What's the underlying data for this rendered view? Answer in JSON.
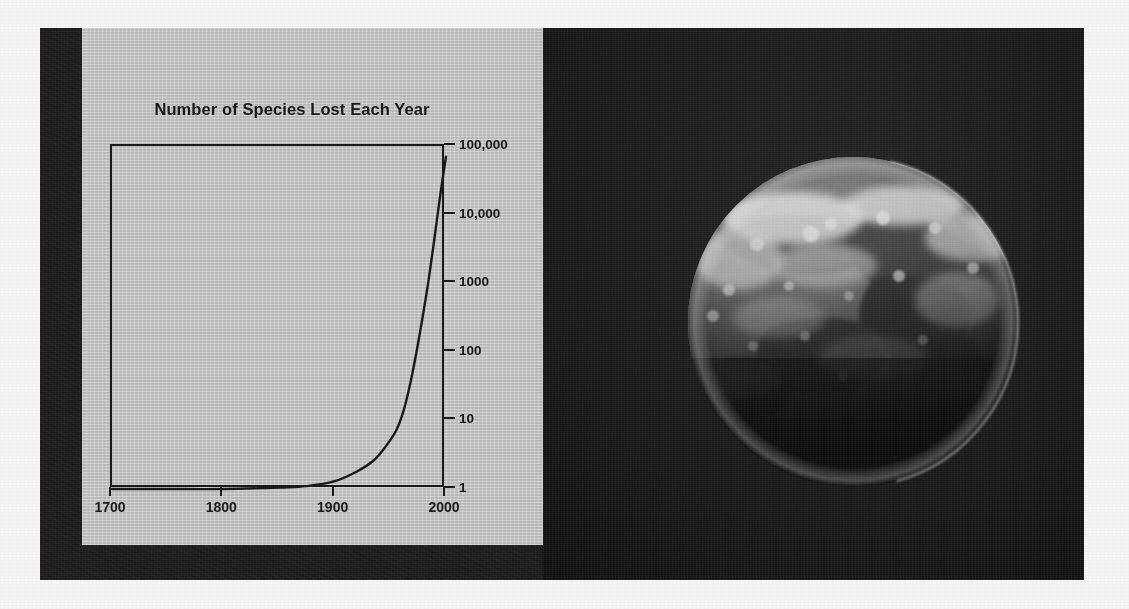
{
  "figure": {
    "plate_background": "#1d1d1d",
    "panel_background": "#c7c7c5",
    "page_background": "#f6f5f3"
  },
  "chart_data": {
    "type": "line",
    "title": "Number of Species Lost Each Year",
    "xlabel": "",
    "ylabel": "",
    "xlim": [
      1700,
      2000
    ],
    "ylim": [
      1,
      100000
    ],
    "yscale": "log",
    "grid": false,
    "legend": null,
    "x_ticks": [
      "1700",
      "1800",
      "1900",
      "2000"
    ],
    "x_tick_values": [
      1700,
      1800,
      1900,
      2000
    ],
    "y_ticks": [
      "1",
      "10",
      "100",
      "1000",
      "10,000",
      "100,000"
    ],
    "y_tick_values": [
      1,
      10,
      100,
      1000,
      10000,
      100000
    ],
    "y_axis_side": "right",
    "line_color": "#1a1a1a",
    "series": [
      {
        "name": "Species lost each year",
        "x": [
          1700,
          1750,
          1800,
          1850,
          1875,
          1900,
          1920,
          1935,
          1945,
          1955,
          1962,
          1968,
          1974,
          1980,
          1985,
          1990,
          1995,
          2000
        ],
        "y": [
          1,
          1,
          1,
          1.05,
          1.1,
          1.3,
          1.8,
          2.6,
          4,
          7,
          14,
          35,
          110,
          400,
          1300,
          5000,
          20000,
          70000
        ]
      }
    ]
  },
  "earth": {
    "caption": "",
    "alt": "Photograph of Earth from space, upper hemisphere illuminated"
  }
}
